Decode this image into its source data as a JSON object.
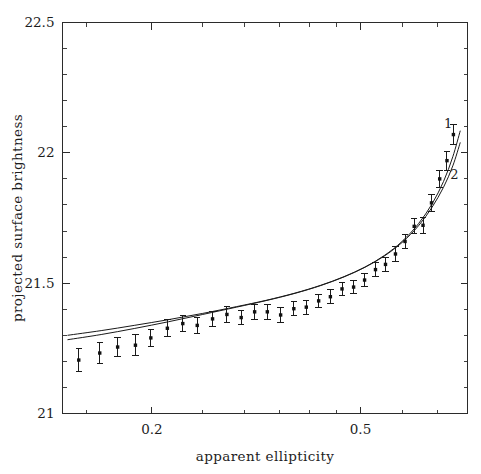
{
  "figure": {
    "width": 481,
    "height": 474,
    "background": "#ffffff",
    "ink_color": "#1a1a1a"
  },
  "chart_data": {
    "type": "scatter",
    "title": "",
    "xlabel": "apparent ellipticity",
    "ylabel": "projected surface brightness",
    "xscale": "log",
    "yscale": "linear",
    "xlim": [
      0.135,
      0.8
    ],
    "ylim": [
      21.0,
      22.5
    ],
    "y_inverted": false,
    "grid": false,
    "legend_position": "inside-right",
    "xticks": [
      0.2,
      0.5
    ],
    "xticklabels": [
      "0.2",
      "0.5"
    ],
    "xticks_minor": [
      0.15,
      0.25,
      0.3,
      0.35,
      0.4,
      0.45,
      0.6,
      0.7,
      0.8
    ],
    "yticks": [
      21,
      21.5,
      22,
      22.5
    ],
    "yticklabels": [
      "21",
      "21.5",
      "22",
      "22.5"
    ],
    "yticks_minor": [
      21.1,
      21.2,
      21.3,
      21.4,
      21.6,
      21.7,
      21.8,
      21.9,
      22.1,
      22.2,
      22.3,
      22.4
    ],
    "annotations": [
      {
        "text": "1",
        "x": 0.735,
        "y": 22.095,
        "name": "curve-label-1"
      },
      {
        "text": "2",
        "x": 0.755,
        "y": 21.9,
        "name": "curve-label-2"
      }
    ],
    "series": [
      {
        "name": "observed",
        "type": "scatter-errorbar",
        "marker": "square",
        "color": "#111111",
        "points": [
          {
            "x": 0.145,
            "y": 21.205,
            "yerr": 0.045
          },
          {
            "x": 0.159,
            "y": 21.232,
            "yerr": 0.04
          },
          {
            "x": 0.172,
            "y": 21.255,
            "yerr": 0.036
          },
          {
            "x": 0.186,
            "y": 21.262,
            "yerr": 0.04
          },
          {
            "x": 0.199,
            "y": 21.29,
            "yerr": 0.034
          },
          {
            "x": 0.214,
            "y": 21.327,
            "yerr": 0.033
          },
          {
            "x": 0.229,
            "y": 21.345,
            "yerr": 0.031
          },
          {
            "x": 0.244,
            "y": 21.338,
            "yerr": 0.03
          },
          {
            "x": 0.261,
            "y": 21.363,
            "yerr": 0.03
          },
          {
            "x": 0.278,
            "y": 21.38,
            "yerr": 0.03
          },
          {
            "x": 0.296,
            "y": 21.368,
            "yerr": 0.028
          },
          {
            "x": 0.314,
            "y": 21.39,
            "yerr": 0.028
          },
          {
            "x": 0.332,
            "y": 21.39,
            "yerr": 0.029
          },
          {
            "x": 0.352,
            "y": 21.378,
            "yerr": 0.028
          },
          {
            "x": 0.373,
            "y": 21.402,
            "yerr": 0.026
          },
          {
            "x": 0.394,
            "y": 21.408,
            "yerr": 0.027
          },
          {
            "x": 0.416,
            "y": 21.432,
            "yerr": 0.026
          },
          {
            "x": 0.438,
            "y": 21.448,
            "yerr": 0.026
          },
          {
            "x": 0.461,
            "y": 21.478,
            "yerr": 0.026
          },
          {
            "x": 0.485,
            "y": 21.485,
            "yerr": 0.026
          },
          {
            "x": 0.509,
            "y": 21.512,
            "yerr": 0.026
          },
          {
            "x": 0.534,
            "y": 21.552,
            "yerr": 0.027
          },
          {
            "x": 0.558,
            "y": 21.572,
            "yerr": 0.026
          },
          {
            "x": 0.583,
            "y": 21.612,
            "yerr": 0.027
          },
          {
            "x": 0.608,
            "y": 21.66,
            "yerr": 0.028
          },
          {
            "x": 0.633,
            "y": 21.718,
            "yerr": 0.029
          },
          {
            "x": 0.658,
            "y": 21.722,
            "yerr": 0.03
          },
          {
            "x": 0.683,
            "y": 21.808,
            "yerr": 0.032
          },
          {
            "x": 0.708,
            "y": 21.9,
            "yerr": 0.034
          },
          {
            "x": 0.731,
            "y": 21.97,
            "yerr": 0.036
          },
          {
            "x": 0.752,
            "y": 22.07,
            "yerr": 0.038
          }
        ]
      },
      {
        "name": "model 1",
        "type": "line",
        "color": "#1a1a1a",
        "label": "1",
        "x": [
          0.138,
          0.16,
          0.185,
          0.215,
          0.25,
          0.29,
          0.33,
          0.375,
          0.42,
          0.465,
          0.51,
          0.555,
          0.6,
          0.645,
          0.685,
          0.72,
          0.75,
          0.775
        ],
        "y": [
          21.3,
          21.318,
          21.338,
          21.36,
          21.384,
          21.41,
          21.434,
          21.462,
          21.492,
          21.525,
          21.562,
          21.606,
          21.66,
          21.728,
          21.805,
          21.89,
          21.985,
          22.085
        ]
      },
      {
        "name": "model 2",
        "type": "line",
        "color": "#1a1a1a",
        "label": "2",
        "x": [
          0.138,
          0.16,
          0.185,
          0.215,
          0.25,
          0.29,
          0.33,
          0.375,
          0.42,
          0.465,
          0.51,
          0.555,
          0.6,
          0.645,
          0.685,
          0.72,
          0.75,
          0.775
        ],
        "y": [
          21.283,
          21.303,
          21.326,
          21.352,
          21.38,
          21.408,
          21.433,
          21.461,
          21.491,
          21.524,
          21.561,
          21.604,
          21.656,
          21.72,
          21.792,
          21.868,
          21.95,
          22.04
        ]
      }
    ]
  }
}
